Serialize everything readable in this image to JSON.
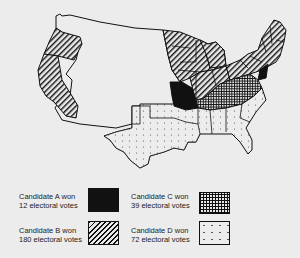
{
  "map": {
    "title": "",
    "description": "Electoral map of the United States showing states won by four candidates"
  },
  "colors": {
    "background": "#ececec",
    "outline": "#111111",
    "candidate_a_fill": "#111111",
    "candidate_b_pattern": "diagonal-hatch",
    "candidate_c_pattern": "crosshatch-grid",
    "candidate_d_pattern": "dotted"
  },
  "legend": {
    "items": [
      {
        "id": "A",
        "line1": "Candidate A  won",
        "line2": "12 electoral votes",
        "pattern": "solid-black"
      },
      {
        "id": "C",
        "line1": "Candidate C won",
        "line2": "39 electoral votes",
        "pattern": "crosshatch"
      },
      {
        "id": "B",
        "line1": "Candidate B won",
        "line2": "180 electoral votes",
        "pattern": "diagonal-stripes"
      },
      {
        "id": "D",
        "line1": "Candidate D won",
        "line2": "72 electoral votes",
        "pattern": "dots"
      }
    ]
  }
}
